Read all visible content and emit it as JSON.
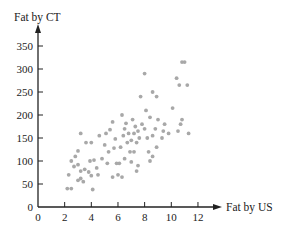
{
  "chart_data": {
    "type": "scatter",
    "title": "",
    "xlabel": "Fat by US",
    "ylabel": "Fat by CT",
    "xlim": [
      0,
      13
    ],
    "ylim": [
      0,
      380
    ],
    "x_ticks": [
      0,
      2,
      4,
      6,
      8,
      10,
      12
    ],
    "y_ticks": [
      0,
      50,
      100,
      150,
      200,
      250,
      300,
      350
    ],
    "grid": false,
    "legend": null,
    "point_color": "#a8a8a8",
    "axis_color": "#222222",
    "series": [
      {
        "name": "observations",
        "points": [
          [
            2.2,
            40
          ],
          [
            2.5,
            40
          ],
          [
            2.3,
            70
          ],
          [
            2.5,
            100
          ],
          [
            2.8,
            110
          ],
          [
            3.0,
            122
          ],
          [
            2.7,
            88
          ],
          [
            3.0,
            58
          ],
          [
            3.2,
            62
          ],
          [
            3.4,
            55
          ],
          [
            3.2,
            78
          ],
          [
            3.5,
            82
          ],
          [
            3.0,
            92
          ],
          [
            3.8,
            76
          ],
          [
            4.0,
            68
          ],
          [
            3.9,
            100
          ],
          [
            4.2,
            102
          ],
          [
            4.1,
            38
          ],
          [
            3.6,
            140
          ],
          [
            4.0,
            140
          ],
          [
            3.2,
            160
          ],
          [
            4.5,
            70
          ],
          [
            4.8,
            105
          ],
          [
            5.0,
            135
          ],
          [
            4.6,
            155
          ],
          [
            5.1,
            160
          ],
          [
            5.3,
            120
          ],
          [
            5.4,
            168
          ],
          [
            5.6,
            185
          ],
          [
            5.8,
            148
          ],
          [
            5.7,
            128
          ],
          [
            5.9,
            95
          ],
          [
            6.1,
            95
          ],
          [
            5.6,
            65
          ],
          [
            6.0,
            70
          ],
          [
            6.3,
            65
          ],
          [
            6.2,
            130
          ],
          [
            6.4,
            155
          ],
          [
            6.5,
            170
          ],
          [
            6.6,
            182
          ],
          [
            6.8,
            160
          ],
          [
            6.3,
            200
          ],
          [
            7.0,
            145
          ],
          [
            6.9,
            120
          ],
          [
            7.0,
            98
          ],
          [
            7.2,
            160
          ],
          [
            7.3,
            175
          ],
          [
            7.5,
            165
          ],
          [
            7.4,
            140
          ],
          [
            7.6,
            150
          ],
          [
            7.8,
            180
          ],
          [
            8.0,
            170
          ],
          [
            8.1,
            210
          ],
          [
            7.7,
            240
          ],
          [
            8.0,
            290
          ],
          [
            8.2,
            150
          ],
          [
            7.2,
            120
          ],
          [
            7.4,
            78
          ],
          [
            7.5,
            90
          ],
          [
            8.3,
            120
          ],
          [
            8.6,
            110
          ],
          [
            8.4,
            195
          ],
          [
            8.6,
            155
          ],
          [
            8.8,
            170
          ],
          [
            8.9,
            130
          ],
          [
            9.0,
            190
          ],
          [
            9.3,
            150
          ],
          [
            9.5,
            180
          ],
          [
            8.6,
            250
          ],
          [
            8.9,
            240
          ],
          [
            9.4,
            165
          ],
          [
            9.8,
            160
          ],
          [
            10.1,
            215
          ],
          [
            10.5,
            165
          ],
          [
            10.7,
            180
          ],
          [
            10.8,
            190
          ],
          [
            10.6,
            265
          ],
          [
            10.4,
            280
          ],
          [
            11.2,
            265
          ],
          [
            10.8,
            315
          ],
          [
            11.0,
            315
          ],
          [
            11.3,
            160
          ],
          [
            6.5,
            105
          ],
          [
            5.2,
            95
          ],
          [
            4.4,
            85
          ],
          [
            6.7,
            140
          ],
          [
            7.1,
            190
          ],
          [
            8.4,
            100
          ]
        ]
      }
    ]
  }
}
